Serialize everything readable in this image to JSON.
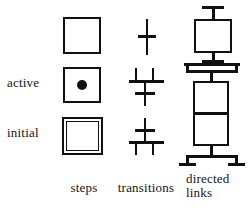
{
  "figure": {
    "kind": "sfc-grafcet-legend",
    "ink_color": "#111111",
    "background": "#ffffff"
  },
  "row_labels": {
    "normal": "",
    "active": "active",
    "initial": "initial"
  },
  "column_captions": {
    "steps": "steps",
    "transitions": "transitions",
    "links_line1": "directed",
    "links_line2": "links"
  },
  "symbols": {
    "steps": [
      {
        "row": "normal",
        "name": "step-plain",
        "description": "single square outline"
      },
      {
        "row": "active",
        "name": "step-active",
        "description": "square outline with filled dot token in centre"
      },
      {
        "row": "initial",
        "name": "step-initial",
        "description": "double square outline"
      }
    ],
    "transitions": [
      {
        "row": "normal",
        "name": "transition-plain",
        "description": "vertical line crossed by one short horizontal bar"
      },
      {
        "row": "active",
        "name": "transition-active",
        "description": "two incoming stubs joined by a wide bar above a crossed vertical line"
      },
      {
        "row": "initial",
        "name": "transition-initial",
        "description": "crossed vertical line above a wide bar splitting into two downward stubs"
      }
    ],
    "directed_links": [
      {
        "row": "normal",
        "name": "link-plain",
        "description": "vertical link entering and leaving a square step"
      },
      {
        "row": "active",
        "name": "link-divergence",
        "description": "vertical link splitting through a wide bar into a square step"
      },
      {
        "row": "initial",
        "name": "link-convergence",
        "description": "square step whose outgoing link splits into two branches"
      }
    ]
  }
}
